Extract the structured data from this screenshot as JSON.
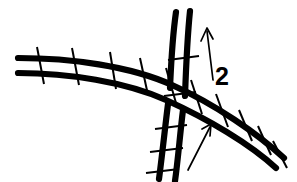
{
  "figure": {
    "type": "track-crossing-diagram",
    "background_color": "#ffffff",
    "line_color": "#000000",
    "width": 297,
    "height": 182
  },
  "labels": [
    {
      "id": "route-number",
      "text": "2",
      "x": 215,
      "y": 85
    }
  ],
  "arrows": [
    {
      "id": "arrow-up",
      "direction": "up",
      "tail": [
        213,
        80
      ],
      "tip": [
        207,
        28
      ]
    },
    {
      "id": "arrow-up-right",
      "direction": "up-right",
      "tail": [
        188,
        170
      ],
      "tip": [
        211,
        124
      ]
    }
  ],
  "tracks": [
    {
      "id": "curved-track",
      "description": "double-track curving from left edge to lower right",
      "rails": [
        "M 18 58 C 70 58, 130 66, 172 85 C 215 104, 258 134, 284 158",
        "M 18 73 C 68 73, 126 82, 166 100 C 208 119, 250 144, 276 168"
      ],
      "ties": [
        [
          37,
          47,
          44,
          84
        ],
        [
          72,
          48,
          79,
          85
        ],
        [
          110,
          52,
          116,
          89
        ],
        [
          140,
          58,
          148,
          95
        ],
        [
          166,
          68,
          176,
          103
        ],
        [
          191,
          80,
          202,
          114
        ],
        [
          216,
          94,
          228,
          127
        ],
        [
          239,
          110,
          252,
          141
        ],
        [
          258,
          126,
          271,
          155
        ],
        [
          273,
          141,
          287,
          168
        ]
      ]
    },
    {
      "id": "vertical-track",
      "description": "double-track running from top down to bottom-left",
      "rails": [
        "M 176 12 C 171 48, 170 92, 166 130 C 163 153, 161 168, 159 179",
        "M 190 11 C 187 48, 186 92, 182 130 C 179 153, 177 169, 175 181"
      ],
      "ties": [
        [
          168,
          60,
          199,
          56
        ],
        [
          164,
          96,
          196,
          92
        ],
        [
          155,
          129,
          187,
          125
        ],
        [
          150,
          152,
          183,
          148
        ],
        [
          146,
          173,
          179,
          169
        ]
      ]
    }
  ],
  "crossing": {
    "id": "diamond-crossing",
    "center": [
      176,
      92
    ],
    "description": "two double-track lines intersect at grade"
  }
}
